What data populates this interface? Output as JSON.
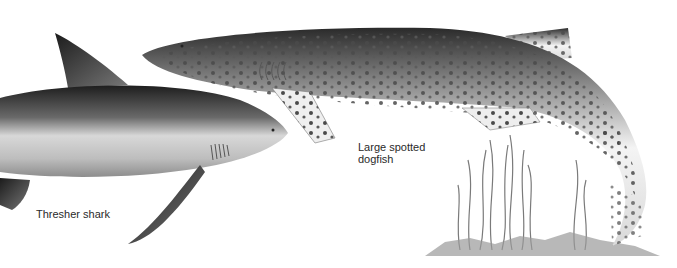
{
  "illustration": {
    "subjects": [
      {
        "id": "thresher",
        "label": "Thresher shark"
      },
      {
        "id": "dogfish",
        "label_line1": "Large spotted",
        "label_line2": "dogfish"
      }
    ],
    "colors": {
      "background": "#ffffff",
      "dark_body": "#2b2b2b",
      "mid_body": "#8a8a8a",
      "belly": "#eeeeee",
      "spots": "#555555",
      "seaweed": "#7a7a7a",
      "label_text": "#2a2a2a"
    }
  }
}
